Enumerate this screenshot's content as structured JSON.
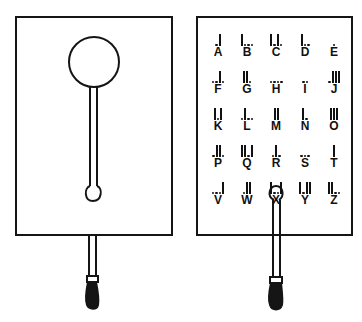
{
  "figure": {
    "left_panel": {
      "label": "plain board with disk and slot",
      "disk": "circular window at top",
      "rod": "slotted pointer rod with handle"
    },
    "right_panel": {
      "label": "code alphabet board",
      "rows": [
        [
          {
            "letter": "A",
            "code": "dot bar"
          },
          {
            "letter": "B",
            "code": "bar dot dot dot"
          },
          {
            "letter": "C",
            "code": "bar dot bar dot"
          },
          {
            "letter": "D",
            "code": "bar dot dot"
          },
          {
            "letter": "E",
            "code": "dot"
          }
        ],
        [
          {
            "letter": "F",
            "code": "dot dot bar dot"
          },
          {
            "letter": "G",
            "code": "bar bar dot"
          },
          {
            "letter": "H",
            "code": "dot dot dot dot"
          },
          {
            "letter": "I",
            "code": "dot dot"
          },
          {
            "letter": "J",
            "code": "dot bar bar bar"
          }
        ],
        [
          {
            "letter": "K",
            "code": "bar dot bar"
          },
          {
            "letter": "L",
            "code": "dot bar dot dot"
          },
          {
            "letter": "M",
            "code": "bar bar"
          },
          {
            "letter": "N",
            "code": "bar dot"
          },
          {
            "letter": "O",
            "code": "bar bar bar"
          }
        ],
        [
          {
            "letter": "P",
            "code": "dot bar bar dot"
          },
          {
            "letter": "Q",
            "code": "bar bar dot bar"
          },
          {
            "letter": "R",
            "code": "dot bar dot"
          },
          {
            "letter": "S",
            "code": "dot dot dot"
          },
          {
            "letter": "T",
            "code": "bar"
          }
        ],
        [
          {
            "letter": "U",
            "code": "dot dot bar"
          },
          {
            "letter": "V",
            "code": "dot dot dot bar"
          },
          {
            "letter": "W",
            "code": "dot bar bar"
          },
          {
            "letter": "X",
            "code": "bar dot dot bar"
          },
          {
            "letter": "Y",
            "code": "bar dot bar bar"
          }
        ],
        [
          {
            "letter": "Z",
            "code": "bar bar dot dot"
          }
        ]
      ]
    },
    "colors": {
      "ink": "#151515",
      "paper": "#ffffff"
    }
  }
}
